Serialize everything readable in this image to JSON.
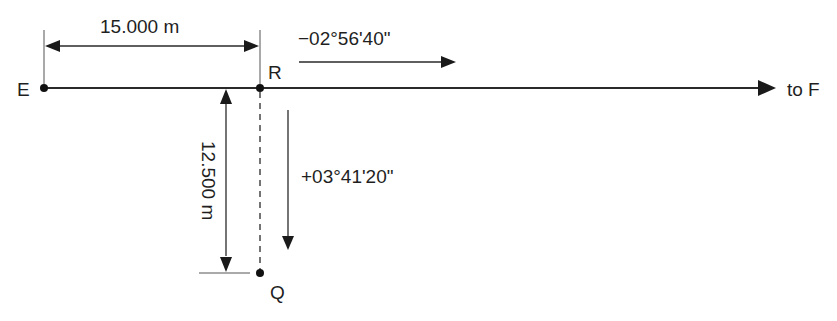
{
  "diagram": {
    "type": "survey-setting-out-sketch",
    "colors": {
      "line": "#2a2a2a",
      "text": "#1f1f1f",
      "background": "#ffffff"
    },
    "points": [
      {
        "id": "E",
        "label": "E"
      },
      {
        "id": "R",
        "label": "R"
      },
      {
        "id": "Q",
        "label": "Q"
      }
    ],
    "baseline": {
      "direction_label": "to F"
    },
    "dimensions": {
      "horizontal": {
        "from": "E",
        "to": "R",
        "label": "15.000 m"
      },
      "vertical": {
        "from": "R",
        "to": "Q",
        "label": "12.500 m"
      }
    },
    "angles": {
      "along_baseline": {
        "label": "−02°56'40\"",
        "direction": "right"
      },
      "toward_Q": {
        "label": "+03°41'20\"",
        "direction": "down"
      }
    }
  }
}
